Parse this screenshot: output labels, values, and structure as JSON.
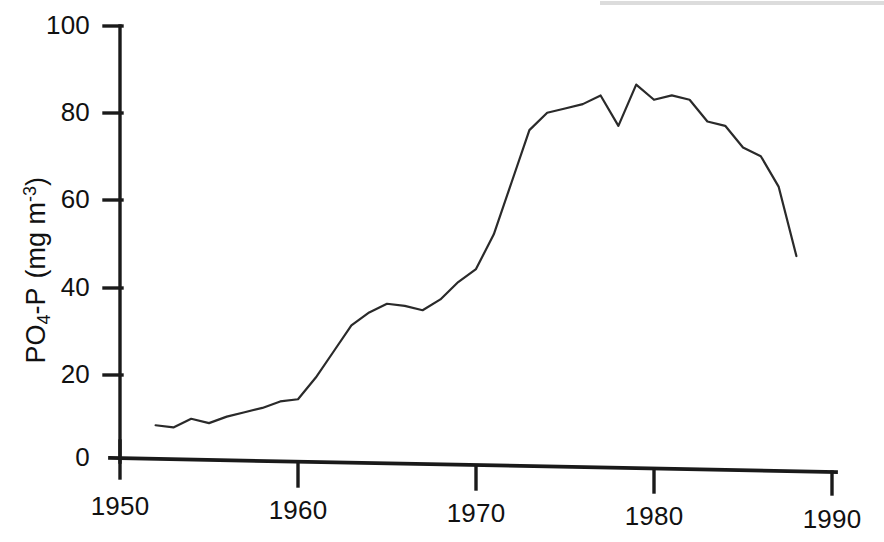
{
  "chart_data": {
    "type": "line",
    "title": "",
    "subtitle": "",
    "xlabel": "",
    "ylabel": "PO4-P  (mg m-3)",
    "ylabel_parts": {
      "prefix": "PO",
      "sub": "4",
      "mid": "-P  (mg m",
      "sup": "-3",
      "suffix": ")"
    },
    "xlim": [
      1950,
      1990
    ],
    "ylim": [
      0,
      100
    ],
    "xticks": [
      1950,
      1960,
      1970,
      1980,
      1990
    ],
    "yticks": [
      0,
      20,
      40,
      60,
      80,
      100
    ],
    "xtick_labels": [
      "1950",
      "1960",
      "1970",
      "1980",
      "1990"
    ],
    "ytick_labels": [
      "0",
      "20",
      "40",
      "60",
      "80",
      "100"
    ],
    "grid": false,
    "legend": false,
    "legend_position": "none",
    "line_color": "#2a2a2a",
    "line_width": 2.2,
    "markers": false,
    "series": [
      {
        "name": "PO4-P concentration",
        "x": [
          1952,
          1953,
          1954,
          1955,
          1956,
          1957,
          1958,
          1959,
          1960,
          1961,
          1962,
          1963,
          1964,
          1965,
          1966,
          1967,
          1968,
          1969,
          1970,
          1971,
          1972,
          1973,
          1974,
          1975,
          1976,
          1977,
          1978,
          1979,
          1980,
          1981,
          1982,
          1983,
          1984,
          1985,
          1986,
          1987,
          1988
        ],
        "values": [
          8,
          7.5,
          9.5,
          8.5,
          10,
          11,
          12,
          13.5,
          14,
          19,
          25,
          31,
          34,
          36,
          35.5,
          34.5,
          37,
          41,
          44,
          52,
          64,
          76,
          80,
          81,
          82,
          84,
          77,
          86.5,
          83,
          84,
          83,
          78,
          77,
          72,
          70,
          63,
          47
        ]
      }
    ],
    "annotations": []
  },
  "axis": {
    "y_tick_labels": [
      {
        "value": "100",
        "y": 26
      },
      {
        "value": "80",
        "y": 113
      },
      {
        "value": "60",
        "y": 200
      },
      {
        "value": "40",
        "y": 288
      },
      {
        "value": "20",
        "y": 375
      },
      {
        "value": "0",
        "y": 460
      }
    ],
    "x_tick_labels": [
      {
        "value": "1950",
        "x": 120
      },
      {
        "value": "1960",
        "x": 298
      },
      {
        "value": "1970",
        "x": 476
      },
      {
        "value": "1980",
        "x": 654
      },
      {
        "value": "1990",
        "x": 832
      }
    ]
  }
}
